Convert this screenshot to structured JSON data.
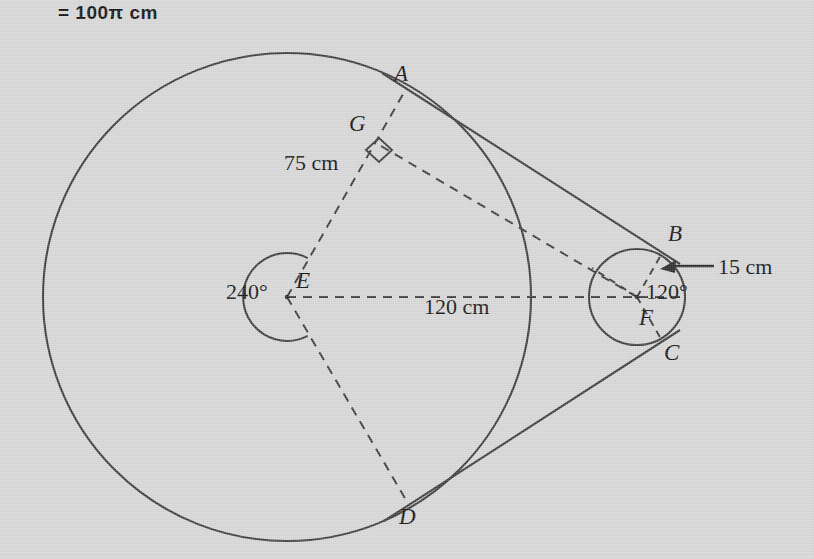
{
  "header": {
    "equation_text": "= 100π cm"
  },
  "diagram": {
    "background_color": "#d6d6d6",
    "stroke_color": "#3d3d3d",
    "text_color": "#131313",
    "point_labels": [
      {
        "id": "A",
        "text": "A",
        "x": 394,
        "y": 62,
        "note": "upper tangent point on large circle"
      },
      {
        "id": "G",
        "text": "G",
        "x": 349,
        "y": 112,
        "note": "foot of perpendicular from E to tangent AB"
      },
      {
        "id": "E",
        "text": "E",
        "x": 296,
        "y": 269,
        "note": "center of large circle"
      },
      {
        "id": "F",
        "text": "F",
        "x": 639,
        "y": 306,
        "note": "center of small circle"
      },
      {
        "id": "B",
        "text": "B",
        "x": 668,
        "y": 222,
        "note": "upper tangent point on small circle"
      },
      {
        "id": "C",
        "text": "C",
        "x": 664,
        "y": 341,
        "note": "lower tangent point on small circle"
      },
      {
        "id": "D",
        "text": "D",
        "x": 399,
        "y": 505,
        "note": "lower tangent point on large circle"
      }
    ],
    "measure_labels": [
      {
        "id": "len-EG",
        "text": "75 cm",
        "x": 284,
        "y": 152
      },
      {
        "id": "len-EF",
        "text": "120 cm",
        "x": 424,
        "y": 296
      },
      {
        "id": "len-FB",
        "text": "15 cm",
        "x": 718,
        "y": 256
      },
      {
        "id": "ang-E",
        "text": "240°",
        "x": 226,
        "y": 281
      },
      {
        "id": "ang-F",
        "text": "120°",
        "x": 646,
        "y": 281
      }
    ],
    "geometry": {
      "large_circle": {
        "cx": 287,
        "cy": 297,
        "r": 244
      },
      "small_circle": {
        "cx": 637,
        "cy": 297,
        "r": 48
      },
      "angle_arc_E": {
        "cx": 287,
        "cy": 297,
        "r": 44,
        "degrees": 240
      },
      "center_line": {
        "x1": 287,
        "y1": 297,
        "x2": 682,
        "y2": 297
      },
      "tangent_points": {
        "A": {
          "x": 406,
          "y": 93
        },
        "B": {
          "x": 660,
          "y": 253
        },
        "C": {
          "x": 660,
          "y": 341
        },
        "D": {
          "x": 408,
          "y": 501
        }
      },
      "perpendicular_foot_G": {
        "x": 378,
        "y": 151
      },
      "right_angle_marker": {
        "x": 378,
        "y": 151,
        "size": 15
      },
      "arrow_15cm": {
        "x1": 712,
        "y1": 266,
        "x2": 662,
        "y2": 266
      }
    }
  }
}
